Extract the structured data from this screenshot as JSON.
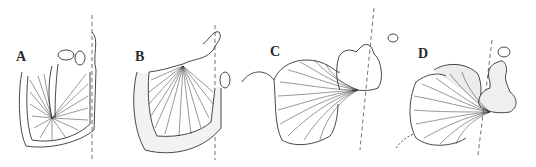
{
  "figure": {
    "panels": [
      {
        "id": "A",
        "label": "A"
      },
      {
        "id": "B",
        "label": "B"
      },
      {
        "id": "C",
        "label": "C"
      },
      {
        "id": "D",
        "label": "D"
      }
    ],
    "colors": {
      "line": "#333333",
      "background": "#ffffff",
      "shade": "#e8e8e8"
    }
  }
}
